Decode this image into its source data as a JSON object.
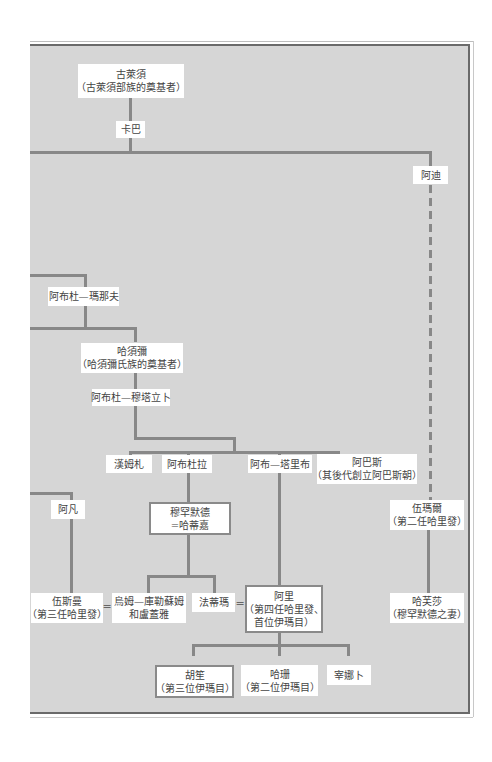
{
  "diagram": {
    "type": "family-tree",
    "nodes": {
      "qusayy": {
        "name": "古萊須",
        "note": "（古萊須部族的奠基者）"
      },
      "kaba": {
        "name": "卡巴"
      },
      "adi": {
        "name": "阿迪"
      },
      "abd_manaf": {
        "name": "阿布杜—瑪那夫"
      },
      "hashim": {
        "name": "哈須彌",
        "note": "（哈須彌氏族的奠基者）"
      },
      "abd_muttalib": {
        "name": "阿布杜—穆塔立卜"
      },
      "hamza": {
        "name": "漢姆札"
      },
      "abdullah": {
        "name": "阿布杜拉"
      },
      "abu_talib": {
        "name": "阿布—塔里布"
      },
      "abbas": {
        "name": "阿巴斯",
        "note": "（其後代創立阿巴斯朝）"
      },
      "affan": {
        "name": "阿凡"
      },
      "muhammad": {
        "name": "穆罕默德",
        "note": "=哈蒂嘉"
      },
      "umar": {
        "name": "伍瑪爾",
        "note": "（第二任哈里發）"
      },
      "uthman": {
        "name": "伍斯曼",
        "note": "（第三任哈里發）"
      },
      "umm_kulthum": {
        "name": "烏姆—庫勒蘇姆",
        "note": "和盧蓋雅"
      },
      "fatima": {
        "name": "法蒂瑪"
      },
      "ali": {
        "name": "阿里",
        "note": "（第四任哈里發、",
        "note2": "首位伊瑪目）"
      },
      "hafsa": {
        "name": "哈芙莎",
        "note": "（穆罕默德之妻）"
      },
      "husayn": {
        "name": "胡笙",
        "note": "（第三位伊瑪目）"
      },
      "hasan": {
        "name": "哈珊",
        "note": "（第二位伊瑪目）"
      },
      "zaynab": {
        "name": "宰娜卜"
      }
    },
    "marriage_symbol": "="
  },
  "colors": {
    "panel_bg": "#d6d6d6",
    "line": "#888888",
    "box_bg": "#ffffff",
    "text": "#444444"
  }
}
